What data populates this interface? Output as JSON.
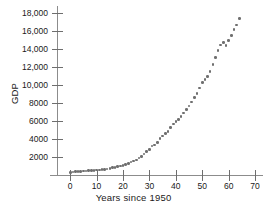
{
  "chart_data": {
    "type": "scatter",
    "title": "",
    "subtitle": "",
    "xlabel": "Years since 1950",
    "ylabel": "GDP",
    "xlim": [
      -5,
      73
    ],
    "ylim": [
      0,
      18800
    ],
    "grid": false,
    "legend": null,
    "marker": {
      "shape": "circle",
      "color": "#6f6f6f",
      "size": 2.6
    },
    "xticks": [
      0,
      10,
      20,
      30,
      40,
      50,
      60,
      70
    ],
    "xticklabels": [
      "0",
      "10",
      "20",
      "30",
      "40",
      "50",
      "60",
      "70"
    ],
    "yticks": [
      2000,
      4000,
      6000,
      8000,
      10000,
      12000,
      14000,
      16000,
      18000
    ],
    "yticklabels": [
      "2000",
      "4000",
      "6000",
      "8000",
      "10,000",
      "12,000",
      "14,000",
      "16,000",
      "18,000"
    ],
    "series": [
      {
        "name": "GDP",
        "x": [
          0,
          1,
          2,
          3,
          4,
          5,
          6,
          7,
          8,
          9,
          10,
          11,
          12,
          13,
          14,
          15,
          16,
          17,
          18,
          19,
          20,
          21,
          22,
          23,
          24,
          25,
          26,
          27,
          28,
          29,
          30,
          31,
          32,
          33,
          34,
          35,
          36,
          37,
          38,
          39,
          40,
          41,
          42,
          43,
          44,
          45,
          46,
          47,
          48,
          49,
          50,
          51,
          52,
          53,
          54,
          55,
          56,
          57,
          58,
          59,
          60,
          61,
          62,
          63,
          64
        ],
        "y": [
          300,
          347,
          368,
          389,
          391,
          427,
          450,
          475,
          482,
          522,
          543,
          563,
          605,
          638,
          685,
          743,
          815,
          861,
          943,
          1020,
          1076,
          1168,
          1282,
          1429,
          1549,
          1689,
          1878,
          2086,
          2357,
          2632,
          2863,
          3211,
          3345,
          3639,
          4041,
          4347,
          4590,
          4870,
          5253,
          5658,
          5980,
          6174,
          6539,
          6879,
          7309,
          7664,
          8100,
          8609,
          9089,
          9661,
          10285,
          10622,
          10978,
          11511,
          12275,
          13094,
          13856,
          14478,
          14719,
          14419,
          14964,
          15518,
          16155,
          16692,
          17393
        ]
      }
    ],
    "annotations": []
  }
}
